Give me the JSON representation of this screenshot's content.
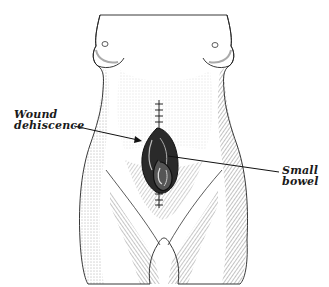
{
  "figure": {
    "style": "stippled engraving, black ink on white",
    "colors": {
      "background": "#ffffff",
      "ink": "#1a1a1a",
      "shade": "#555555"
    }
  },
  "labels": {
    "wound_dehiscence": {
      "line1": "Wound",
      "line2": "dehiscence"
    },
    "small_bowel": {
      "line1": "Small",
      "line2": "bowel"
    }
  },
  "annotations": [
    {
      "name": "wound-dehiscence-pointer",
      "type": "arrow",
      "from": [
        74,
        126
      ],
      "to": [
        141,
        141
      ]
    },
    {
      "name": "small-bowel-pointer",
      "type": "line",
      "from": [
        168,
        156
      ],
      "to": [
        279,
        172
      ]
    }
  ]
}
